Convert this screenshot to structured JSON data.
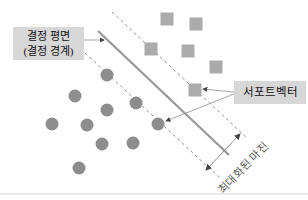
{
  "figure": {
    "type": "svm-concept-diagram",
    "background": "#ffffff",
    "labels": {
      "decision_plane_line1": "결정 평면",
      "decision_plane_line2": "(결정 경계)",
      "support_vector": "서포트벡터",
      "maximized_margin": "최대화된 마진"
    },
    "colors": {
      "circle_fill": "#8d8d8d",
      "square_fill": "#ababab",
      "decision_line": "#9a9a9a",
      "margin_dashed": "#8f8f8f",
      "pointer": "#8f8f8f",
      "arrowhead": "#444444",
      "label_bg": "#d7d7d7",
      "label_text": "#111111",
      "margin_text": "#555555",
      "baseline": "#cccccc"
    },
    "geometry": {
      "circles": [
        [
          107,
          75
        ],
        [
          75,
          96
        ],
        [
          136,
          103
        ],
        [
          107,
          110
        ],
        [
          52,
          124
        ],
        [
          87,
          125
        ],
        [
          158,
          124
        ],
        [
          102,
          144
        ],
        [
          133,
          143
        ],
        [
          79,
          168
        ]
      ],
      "circle_radius": 6.5,
      "squares": [
        [
          167,
          19
        ],
        [
          196,
          24
        ],
        [
          151,
          49
        ],
        [
          188,
          51
        ],
        [
          216,
          67
        ],
        [
          195,
          90
        ]
      ],
      "square_size": 13,
      "support_vector_circle_index": 6,
      "support_vector_square_index": 5,
      "decision_line": [
        98,
        31,
        229,
        155
      ],
      "margin_upper_dashed": [
        112,
        12,
        247,
        138
      ],
      "margin_lower_dashed": [
        85,
        53,
        221,
        179
      ],
      "margin_width_arrow": [
        206,
        170,
        240,
        134
      ],
      "pointer_to_decision_line": [
        84,
        40,
        104,
        40
      ],
      "pointer_to_square_sv": [
        234,
        92,
        203,
        89
      ],
      "pointer_to_circle_sv": [
        234,
        94,
        166,
        121
      ],
      "baseline_y": 194
    }
  }
}
